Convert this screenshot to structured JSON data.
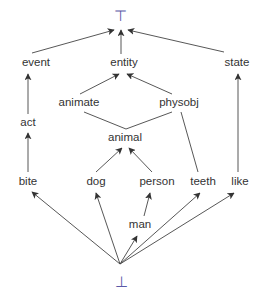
{
  "colors": {
    "edge": "#444444",
    "label": "#333333",
    "top_bottom_symbol": "#5a5aa8"
  },
  "top": {
    "symbol": "⊤",
    "x": 120,
    "y": 15
  },
  "bottom": {
    "symbol": "⊥",
    "x": 121,
    "y": 281
  },
  "nodes": [
    {
      "id": "event",
      "label": "event",
      "x": 36,
      "y": 63
    },
    {
      "id": "entity",
      "label": "entity",
      "x": 124,
      "y": 63
    },
    {
      "id": "state",
      "label": "state",
      "x": 237,
      "y": 63
    },
    {
      "id": "animate",
      "label": "animate",
      "x": 79,
      "y": 103
    },
    {
      "id": "physobj",
      "label": "physobj",
      "x": 179,
      "y": 103
    },
    {
      "id": "act",
      "label": "act",
      "x": 28,
      "y": 123
    },
    {
      "id": "animal",
      "label": "animal",
      "x": 125,
      "y": 138
    },
    {
      "id": "bite",
      "label": "bite",
      "x": 28,
      "y": 182
    },
    {
      "id": "dog",
      "label": "dog",
      "x": 96,
      "y": 182
    },
    {
      "id": "person",
      "label": "person",
      "x": 157,
      "y": 182
    },
    {
      "id": "teeth",
      "label": "teeth",
      "x": 203,
      "y": 182
    },
    {
      "id": "like",
      "label": "like",
      "x": 240,
      "y": 182
    },
    {
      "id": "man",
      "label": "man",
      "x": 140,
      "y": 225
    }
  ],
  "edges": [
    {
      "from": "event",
      "to": "top",
      "arrow": true,
      "x1": 32,
      "y1": 53,
      "x2": 114,
      "y2": 30
    },
    {
      "from": "entity",
      "to": "top",
      "arrow": true,
      "x1": 121,
      "y1": 54,
      "x2": 121,
      "y2": 30
    },
    {
      "from": "state",
      "to": "top",
      "arrow": true,
      "x1": 224,
      "y1": 52,
      "x2": 128,
      "y2": 30
    },
    {
      "from": "animate",
      "to": "entity",
      "arrow": true,
      "x1": 80,
      "y1": 94,
      "x2": 119,
      "y2": 74
    },
    {
      "from": "physobj",
      "to": "entity",
      "arrow": true,
      "x1": 172,
      "y1": 94,
      "x2": 127,
      "y2": 74
    },
    {
      "from": "act",
      "to": "event",
      "arrow": true,
      "x1": 28,
      "y1": 114,
      "x2": 28,
      "y2": 74
    },
    {
      "from": "like",
      "to": "state",
      "arrow": true,
      "x1": 238,
      "y1": 172,
      "x2": 238,
      "y2": 74
    },
    {
      "from": "animal",
      "to": "animate",
      "arrow": false,
      "x1": 126,
      "y1": 129,
      "x2": 84,
      "y2": 112
    },
    {
      "from": "animal",
      "to": "physobj",
      "arrow": false,
      "x1": 126,
      "y1": 129,
      "x2": 172,
      "y2": 112
    },
    {
      "from": "teeth",
      "to": "physobj",
      "arrow": false,
      "x1": 198,
      "y1": 172,
      "x2": 181,
      "y2": 112
    },
    {
      "from": "bite",
      "to": "act",
      "arrow": true,
      "x1": 28,
      "y1": 172,
      "x2": 28,
      "y2": 133
    },
    {
      "from": "dog",
      "to": "animal",
      "arrow": true,
      "x1": 96,
      "y1": 172,
      "x2": 122,
      "y2": 148
    },
    {
      "from": "person",
      "to": "animal",
      "arrow": true,
      "x1": 152,
      "y1": 172,
      "x2": 129,
      "y2": 148
    },
    {
      "from": "man",
      "to": "person",
      "arrow": true,
      "x1": 144,
      "y1": 216,
      "x2": 150,
      "y2": 193
    },
    {
      "from": "bottom",
      "to": "bite",
      "arrow": true,
      "x1": 120,
      "y1": 264,
      "x2": 32,
      "y2": 192
    },
    {
      "from": "bottom",
      "to": "dog",
      "arrow": true,
      "x1": 120,
      "y1": 264,
      "x2": 96,
      "y2": 193
    },
    {
      "from": "bottom",
      "to": "man",
      "arrow": true,
      "x1": 120,
      "y1": 264,
      "x2": 137,
      "y2": 236
    },
    {
      "from": "bottom",
      "to": "teeth",
      "arrow": true,
      "x1": 120,
      "y1": 264,
      "x2": 200,
      "y2": 193
    },
    {
      "from": "bottom",
      "to": "like",
      "arrow": true,
      "x1": 120,
      "y1": 264,
      "x2": 234,
      "y2": 193
    }
  ]
}
